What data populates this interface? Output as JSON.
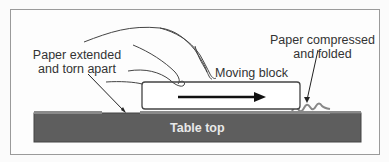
{
  "diagram": {
    "labels": {
      "paper_extended": [
        "Paper extended",
        "and torn apart"
      ],
      "moving_block": "Moving block",
      "paper_compressed": [
        "Paper compressed",
        "and folded"
      ],
      "table_top": "Table top"
    },
    "colors": {
      "table": "#5e5e5e",
      "paper": "#8a8a8a",
      "frame": "#9a9a9a",
      "arrow": "#111111"
    }
  }
}
